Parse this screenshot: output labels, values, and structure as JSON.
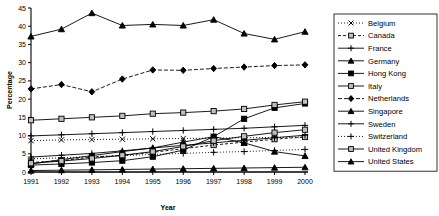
{
  "chart_data": {
    "type": "line",
    "title": "",
    "xlabel": "Year",
    "ylabel": "Percentage",
    "categories": [
      1991,
      1992,
      1993,
      1994,
      1995,
      1996,
      1997,
      1998,
      1999,
      2000
    ],
    "x_tick_labels": [
      "1991",
      "1992",
      "1993",
      "1994",
      "1995",
      "1996",
      "1997",
      "1998",
      "1999",
      "2000"
    ],
    "y_tick_labels": [
      "0",
      "5",
      "10",
      "15",
      "20",
      "25",
      "30",
      "35",
      "40",
      "45"
    ],
    "ylim": [
      0,
      45
    ],
    "y_step": 5,
    "grid": false,
    "legend_position": "right",
    "series": [
      {
        "name": "Belgium",
        "marker": "x",
        "dash": "1,2",
        "filled": false,
        "values": [
          8.6,
          8.8,
          8.9,
          9.0,
          9.1,
          9.2,
          9.3,
          9.4,
          9.5,
          9.6
        ]
      },
      {
        "name": "Canada",
        "marker": "square",
        "dash": "3,2",
        "filled": false,
        "values": [
          2.6,
          3.1,
          4.1,
          4.5,
          5.4,
          6.4,
          7.4,
          8.2,
          9.0,
          9.6
        ]
      },
      {
        "name": "France",
        "marker": "plus",
        "dash": "none",
        "filled": false,
        "values": [
          9.9,
          10.2,
          10.5,
          10.8,
          11.1,
          11.4,
          11.7,
          12.0,
          12.4,
          12.8
        ]
      },
      {
        "name": "Germany",
        "marker": "triangle",
        "dash": "none",
        "filled": true,
        "values": [
          37.2,
          39.2,
          43.6,
          40.2,
          40.5,
          40.2,
          41.8,
          38.0,
          36.4,
          38.5
        ]
      },
      {
        "name": "Hong Kong",
        "marker": "square",
        "dash": "none",
        "filled": true,
        "values": [
          1.9,
          2.2,
          2.6,
          3.1,
          4.2,
          6.0,
          9.7,
          14.6,
          17.6,
          18.8
        ]
      },
      {
        "name": "Italy",
        "marker": "square",
        "dash": "none",
        "filled": false,
        "values": [
          14.2,
          14.6,
          15.0,
          15.4,
          16.0,
          16.3,
          16.7,
          17.3,
          18.4,
          19.3
        ]
      },
      {
        "name": "Netherlands",
        "marker": "diamond",
        "dash": "4,2",
        "filled": true,
        "values": [
          22.8,
          24.0,
          22.0,
          25.5,
          28.0,
          27.9,
          28.4,
          28.8,
          29.2,
          29.4
        ]
      },
      {
        "name": "Singapore",
        "marker": "triangle",
        "dash": "none",
        "filled": true,
        "values": [
          2.2,
          3.4,
          4.5,
          5.6,
          6.6,
          8.2,
          9.7,
          8.0,
          5.6,
          4.4
        ]
      },
      {
        "name": "Sweden",
        "marker": "plus",
        "dash": "none",
        "filled": false,
        "values": [
          4.1,
          4.6,
          5.1,
          5.8,
          6.6,
          7.3,
          8.0,
          8.7,
          9.4,
          10.1
        ]
      },
      {
        "name": "Switzerland",
        "marker": "plus",
        "dash": "1,2",
        "filled": false,
        "values": [
          3.6,
          3.9,
          4.2,
          4.5,
          4.8,
          5.1,
          5.4,
          5.6,
          5.9,
          6.2
        ]
      },
      {
        "name": "United Kingdom",
        "marker": "square",
        "dash": "none",
        "filled": false,
        "values": [
          2.4,
          3.0,
          3.7,
          4.6,
          5.6,
          7.0,
          8.6,
          9.8,
          10.8,
          11.6
        ]
      },
      {
        "name": "United States",
        "marker": "triangle",
        "dash": "none",
        "filled": true,
        "values": [
          0.4,
          0.5,
          0.6,
          0.7,
          0.8,
          0.9,
          1.0,
          1.1,
          1.2,
          1.3
        ]
      }
    ]
  }
}
